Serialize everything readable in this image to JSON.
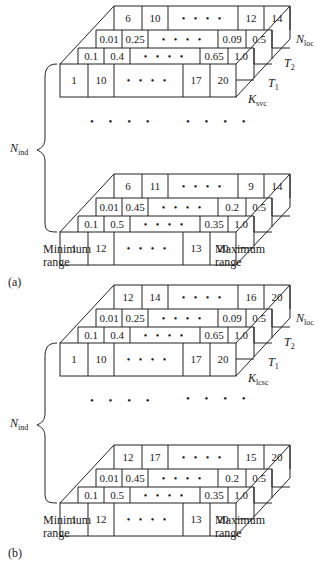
{
  "figure": {
    "panels": [
      {
        "caption": "(a)",
        "k_label_main": "K",
        "k_label_sub": "svc",
        "blocks": [
          {
            "top_row": [
              "6",
              "10",
              "• • • •",
              "12",
              "14"
            ],
            "mid_row": [
              "0.01",
              "0.25",
              "• • • •",
              "0.09",
              "0.5"
            ],
            "back_row": [
              "0.1",
              "0.4",
              "• • • •",
              "0.65",
              "1.0"
            ],
            "front_row": [
              "1",
              "10",
              "• • • •",
              "17",
              "20"
            ]
          },
          {
            "top_row": [
              "6",
              "11",
              "• • • •",
              "9",
              "14"
            ],
            "mid_row": [
              "0.01",
              "0.45",
              "• • • •",
              "0.2",
              "0.5"
            ],
            "back_row": [
              "0.1",
              "0.5",
              "• • • •",
              "0.35",
              "1.0"
            ],
            "front_row": [
              "1",
              "12",
              "• • • •",
              "13",
              "20"
            ]
          }
        ]
      },
      {
        "caption": "(b)",
        "k_label_main": "K",
        "k_label_sub": "lcsc",
        "blocks": [
          {
            "top_row": [
              "12",
              "14",
              "• • • •",
              "16",
              "20"
            ],
            "mid_row": [
              "0.01",
              "0.25",
              "• • • •",
              "0.09",
              "0.5"
            ],
            "back_row": [
              "0.1",
              "0.4",
              "• • • •",
              "0.65",
              "1.0"
            ],
            "front_row": [
              "1",
              "10",
              "• • • •",
              "17",
              "20"
            ]
          },
          {
            "top_row": [
              "12",
              "17",
              "• • • •",
              "15",
              "20"
            ],
            "mid_row": [
              "0.01",
              "0.45",
              "• • • •",
              "0.2",
              "0.5"
            ],
            "back_row": [
              "0.1",
              "0.5",
              "• • • •",
              "0.35",
              "1.0"
            ],
            "front_row": [
              "1",
              "12",
              "• • • •",
              "13",
              "20"
            ]
          }
        ]
      }
    ],
    "labels": {
      "n_loc_main": "N",
      "n_loc_sub": "loc",
      "t2_main": "T",
      "t2_sub": "2",
      "t1_main": "T",
      "t1_sub": "1",
      "n_ind_main": "N",
      "n_ind_sub": "ind",
      "ellipsis": "• • • •",
      "min_range_line1": "Minimum",
      "min_range_line2": "range",
      "max_range_line1": "Maximum",
      "max_range_line2": "range"
    }
  }
}
